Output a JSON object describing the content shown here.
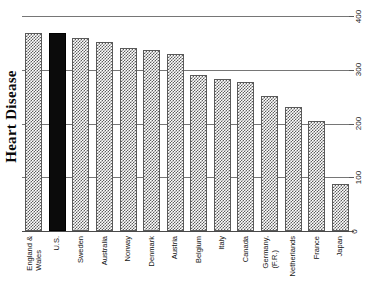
{
  "chart_data": {
    "type": "bar",
    "title": "Heart Disease",
    "xlabel": "",
    "ylabel": "Heart Disease",
    "orientation": "vertical",
    "grid": true,
    "legend": "none",
    "ylim": [
      0,
      400
    ],
    "yticks": [
      0,
      100,
      200,
      300,
      400
    ],
    "ytick_labels": [
      "0",
      "100",
      "200",
      "300",
      "400"
    ],
    "axis_position": "right",
    "categories": [
      "England &\nWales",
      "U.S.",
      "Sweden",
      "Australia",
      "Norway",
      "Denmark",
      "Austria",
      "Belgium",
      "Italy",
      "Canada",
      "Germany,\n(F.R.)",
      "Netherlands",
      "France",
      "Japan"
    ],
    "values": [
      368,
      368,
      360,
      352,
      340,
      336,
      330,
      290,
      282,
      278,
      252,
      230,
      204,
      88
    ],
    "highlight_index": 1,
    "colors": {
      "bar_fill": "#5e5e5e",
      "bar_background": "#ffffff",
      "bar_border": "#5a5a5a",
      "highlight_fill": "#0b0b0b",
      "gridline": "#767676",
      "baseline": "#4a4a4a",
      "text": "#111111",
      "page_background": "#ffffff"
    }
  }
}
